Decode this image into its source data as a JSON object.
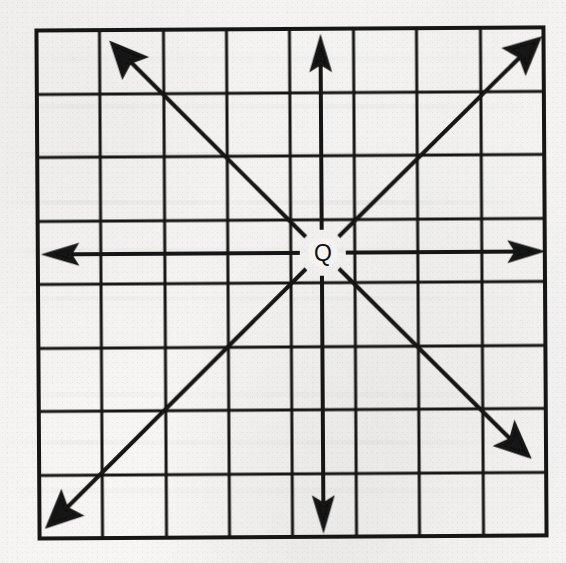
{
  "figure": {
    "center_label": "Q",
    "ink_color": "#121212",
    "paper_color": "#f3f2f0",
    "grid": {
      "columns": 8,
      "rows": 8,
      "left": 38,
      "top": 29,
      "right": 545,
      "bottom": 537,
      "cell_width": 63.4,
      "cell_height": 63.5,
      "line_width": 3,
      "border_width": 4,
      "x_lines": [
        38,
        101,
        165,
        228,
        291,
        355,
        418,
        482,
        545
      ],
      "y_lines": [
        29,
        93,
        156,
        220,
        283,
        347,
        410,
        474,
        537
      ]
    },
    "center_point": {
      "label": "Q",
      "x": 323,
      "y": 253,
      "gap_radius": 23,
      "label_font_size": 23
    },
    "rays": [
      {
        "name": "ray-north",
        "direction": "N",
        "angle_deg": 90,
        "tip_x": 322,
        "tip_y": 42
      },
      {
        "name": "ray-northeast",
        "direction": "NE",
        "angle_deg": 45,
        "tip_x": 540,
        "tip_y": 41
      },
      {
        "name": "ray-east",
        "direction": "E",
        "angle_deg": 0,
        "tip_x": 538,
        "tip_y": 253
      },
      {
        "name": "ray-southeast",
        "direction": "SE",
        "angle_deg": -45,
        "tip_x": 527,
        "tip_y": 456
      },
      {
        "name": "ray-south",
        "direction": "S",
        "angle_deg": -90,
        "tip_x": 322,
        "tip_y": 527
      },
      {
        "name": "ray-southwest",
        "direction": "SW",
        "angle_deg": -135,
        "tip_x": 47,
        "tip_y": 524
      },
      {
        "name": "ray-west",
        "direction": "W",
        "angle_deg": 180,
        "tip_x": 48,
        "tip_y": 253
      },
      {
        "name": "ray-northwest",
        "direction": "NW",
        "angle_deg": 135,
        "tip_x": 114,
        "tip_y": 43
      }
    ],
    "ray_style": {
      "line_width": 4,
      "arrowhead_length": 24,
      "arrowhead_half_width": 7
    }
  }
}
